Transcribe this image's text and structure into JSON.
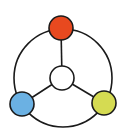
{
  "diagram": {
    "type": "hub-and-ring network icon",
    "stroke_color": "#1a1a1a",
    "ring": {
      "cx": 63,
      "cy": 78,
      "r": 49
    },
    "hub": {
      "name": "center-node",
      "cx": 62,
      "cy": 78,
      "r": 12,
      "fill": "#ffffff"
    },
    "nodes": [
      {
        "name": "top-node",
        "cx": 61,
        "cy": 28,
        "r": 12,
        "fill": "#E8491F"
      },
      {
        "name": "bottom-left-node",
        "cx": 22,
        "cy": 104,
        "r": 12,
        "fill": "#6BB1E3"
      },
      {
        "name": "bottom-right-node",
        "cx": 104,
        "cy": 103,
        "r": 12,
        "fill": "#D5DB52"
      }
    ]
  }
}
